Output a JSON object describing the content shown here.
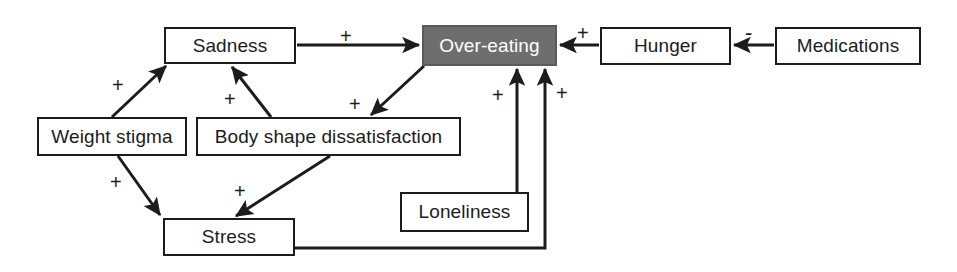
{
  "diagram": {
    "type": "causal-loop-diagram",
    "canvas": {
      "width": 957,
      "height": 272
    },
    "colors": {
      "background": "#ffffff",
      "node_fill": "#ffffff",
      "node_border": "#1c1c1c",
      "node_text": "#1c1c1c",
      "highlight_fill": "#6e6e6e",
      "highlight_text": "#ffffff",
      "edge": "#1c1c1c"
    },
    "nodes": [
      {
        "id": "sadness",
        "label": "Sadness",
        "x": 164,
        "y": 27,
        "w": 132,
        "h": 37,
        "highlight": false
      },
      {
        "id": "overeating",
        "label": "Over-eating",
        "x": 422,
        "y": 25,
        "w": 135,
        "h": 41,
        "highlight": true
      },
      {
        "id": "hunger",
        "label": "Hunger",
        "x": 600,
        "y": 27,
        "w": 131,
        "h": 38,
        "highlight": false
      },
      {
        "id": "medications",
        "label": "Medications",
        "x": 775,
        "y": 27,
        "w": 146,
        "h": 38,
        "highlight": false
      },
      {
        "id": "weight",
        "label": "Weight stigma",
        "x": 37,
        "y": 117,
        "w": 150,
        "h": 39,
        "highlight": false
      },
      {
        "id": "bodyshape",
        "label": "Body shape dissatisfaction",
        "x": 196,
        "y": 117,
        "w": 265,
        "h": 39,
        "highlight": false
      },
      {
        "id": "loneliness",
        "label": "Loneliness",
        "x": 400,
        "y": 192,
        "w": 129,
        "h": 40,
        "highlight": false
      },
      {
        "id": "stress",
        "label": "Stress",
        "x": 163,
        "y": 218,
        "w": 132,
        "h": 38,
        "highlight": false
      }
    ],
    "edges": [
      {
        "id": "weight-to-sadness",
        "from": "weight",
        "to": "sadness",
        "sign": "+",
        "sign_x": 112,
        "sign_y": 75
      },
      {
        "id": "weight-to-stress",
        "from": "weight",
        "to": "stress",
        "sign": "+",
        "sign_x": 110,
        "sign_y": 172
      },
      {
        "id": "bodyshape-to-sadness",
        "from": "bodyshape",
        "to": "sadness",
        "sign": "+",
        "sign_x": 224,
        "sign_y": 89
      },
      {
        "id": "bodyshape-to-stress",
        "from": "bodyshape",
        "to": "stress",
        "sign": "+",
        "sign_x": 234,
        "sign_y": 181
      },
      {
        "id": "sadness-to-overeating",
        "from": "sadness",
        "to": "overeating",
        "sign": "+",
        "sign_x": 340,
        "sign_y": 26
      },
      {
        "id": "overeating-to-bodyshape",
        "from": "overeating",
        "to": "bodyshape",
        "sign": "+",
        "sign_x": 349,
        "sign_y": 94
      },
      {
        "id": "loneliness-to-overeating",
        "from": "loneliness",
        "to": "overeating",
        "sign": "+",
        "sign_x": 492,
        "sign_y": 85
      },
      {
        "id": "stress-to-overeating",
        "from": "stress",
        "to": "overeating",
        "sign": "+",
        "sign_x": 556,
        "sign_y": 83
      },
      {
        "id": "hunger-to-overeating",
        "from": "hunger",
        "to": "overeating",
        "sign": "+",
        "sign_x": 577,
        "sign_y": 23
      },
      {
        "id": "medications-to-hunger",
        "from": "medications",
        "to": "hunger",
        "sign": "-",
        "sign_x": 745,
        "sign_y": 22
      }
    ]
  }
}
